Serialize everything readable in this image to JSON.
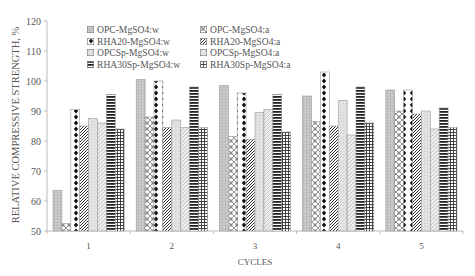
{
  "chart_data": {
    "type": "bar",
    "title": "",
    "xlabel": "CYCLES",
    "ylabel": "RELATIVE COMPRESSIVE STRENGTH, %",
    "ylim": [
      50,
      120
    ],
    "yticks": [
      50,
      60,
      70,
      80,
      90,
      100,
      110,
      120
    ],
    "grid": false,
    "legend_position": "top-center, inside plot, 2 columns",
    "categories": [
      "1",
      "2",
      "3",
      "4",
      "5"
    ],
    "series": [
      {
        "name": "OPC-MgSO4:w",
        "pattern": "light-gray-dots",
        "values": [
          63.5,
          100.5,
          98.5,
          95.0,
          97.0
        ]
      },
      {
        "name": "OPC-MgSO4:a",
        "pattern": "crosshatch-circles",
        "values": [
          52.5,
          88.0,
          81.5,
          86.5,
          90.0
        ]
      },
      {
        "name": "RHA20-MgSO4:w",
        "pattern": "black-diamonds",
        "values": [
          90.5,
          100.0,
          96.0,
          103.0,
          97.0
        ]
      },
      {
        "name": "RHA20-MgSO4:a",
        "pattern": "dense-diagonal",
        "values": [
          85.0,
          84.5,
          80.5,
          85.0,
          89.0
        ]
      },
      {
        "name": "OPCSp-MgSO4:w",
        "pattern": "very-light-dots",
        "values": [
          87.5,
          87.0,
          89.5,
          93.5,
          90.0
        ]
      },
      {
        "name": "OPCSp-MgSO4:a",
        "pattern": "light-diagonal",
        "values": [
          86.0,
          84.5,
          90.5,
          82.0,
          84.0
        ]
      },
      {
        "name": "RHA30Sp-MgSO4:w",
        "pattern": "horizontal-stripes",
        "values": [
          95.5,
          98.0,
          95.5,
          98.0,
          91.0
        ]
      },
      {
        "name": "RHA30Sp-MgSO4:a",
        "pattern": "grid",
        "values": [
          84.0,
          84.5,
          83.0,
          86.0,
          84.5
        ]
      }
    ]
  },
  "labels": {
    "ylabel": "RELATIVE COMPRESSIVE STRENGTH, %",
    "xlabel": "CYCLES"
  },
  "legend": [
    "OPC-MgSO4:w",
    "OPC-MgSO4:a",
    "RHA20-MgSO4:w",
    "RHA20-MgSO4:a",
    "OPCSp-MgSO4:w",
    "OPCSp-MgSO4:a",
    "RHA30Sp-MgSO4:w",
    "RHA30Sp-MgSO4:a"
  ]
}
